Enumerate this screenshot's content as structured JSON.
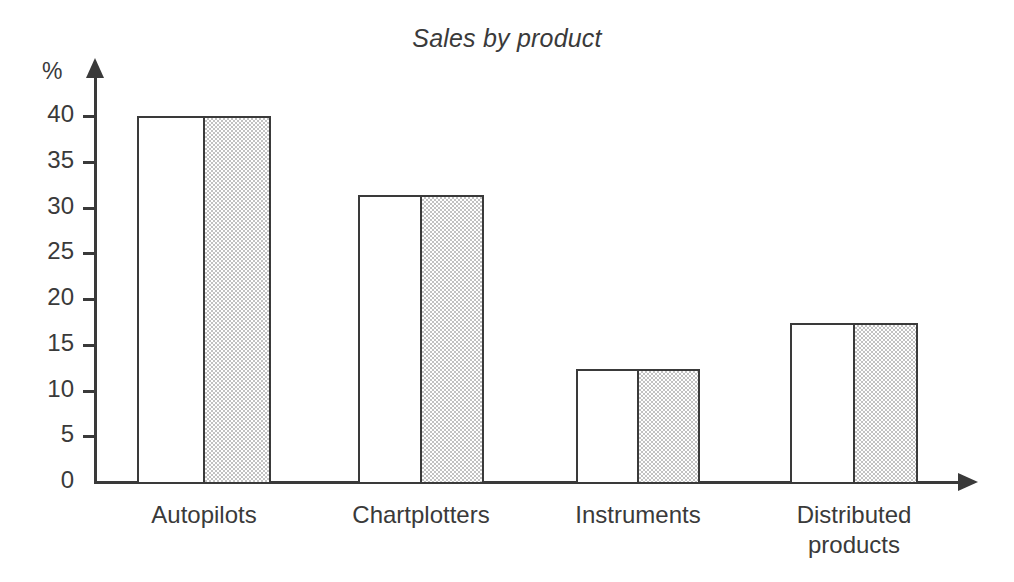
{
  "chart_data": {
    "type": "bar",
    "title": "Sales by product",
    "xlabel": "",
    "ylabel": "%",
    "categories": [
      "Autopilots",
      "Chartplotters",
      "Instruments",
      "Distributed\nproducts"
    ],
    "values": [
      40,
      31.4,
      12.3,
      17.4
    ],
    "ytick_labels": [
      "40",
      "35",
      "30",
      "25",
      "20",
      "15",
      "10",
      "5",
      "0"
    ],
    "ytick_values": [
      40,
      35,
      30,
      25,
      20,
      15,
      10,
      5,
      0
    ],
    "ylim": [
      0,
      40
    ],
    "grid": false,
    "legend": "none",
    "axis_style": "arrow-tipped",
    "bar_style": "half-white-half-stippled-gray",
    "colors": {
      "axis": "#3a3a3a",
      "bar_outline": "#3a3a3a",
      "bar_light_fill": "#ffffff",
      "bar_shaded_fill": "#c2c2c2",
      "background": "#ffffff",
      "text": "#3a3a3a"
    }
  }
}
